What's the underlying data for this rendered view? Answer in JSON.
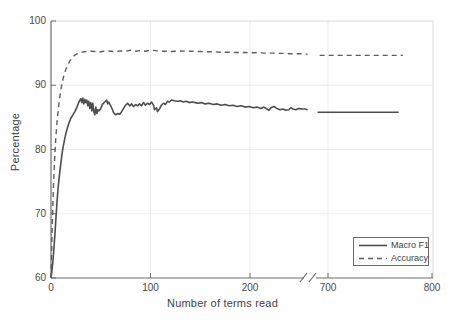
{
  "chart_data": {
    "type": "line",
    "title": "",
    "xlabel": "Number of terms read",
    "ylabel": "Percentage",
    "ylim": [
      60,
      100
    ],
    "yticks": [
      {
        "value": 60,
        "label": "60"
      },
      {
        "value": 70,
        "label": "70"
      },
      {
        "value": 80,
        "label": "80"
      },
      {
        "value": 90,
        "label": "90"
      },
      {
        "value": 100,
        "label": "100"
      }
    ],
    "xticks": [
      {
        "value": 0,
        "label": "0"
      },
      {
        "value": 100,
        "label": "100"
      },
      {
        "value": 200,
        "label": "200"
      },
      {
        "value": 700,
        "label": "700"
      },
      {
        "value": 800,
        "label": "800"
      }
    ],
    "x_axis_break": {
      "between": [
        260,
        690
      ],
      "style": "double-slash"
    },
    "grid": true,
    "legend_position": "lower-right",
    "series": [
      {
        "name": "Macro F1",
        "style": "solid",
        "color": "#4d4d4d",
        "segments": [
          [
            [
              0,
              60
            ],
            [
              1,
              61.2
            ],
            [
              2,
              62.8
            ],
            [
              3,
              64.8
            ],
            [
              4,
              67
            ],
            [
              5,
              69.5
            ],
            [
              6,
              71.8
            ],
            [
              7,
              73.8
            ],
            [
              8,
              75.4
            ],
            [
              9,
              76.8
            ],
            [
              10,
              78
            ],
            [
              11,
              79.2
            ],
            [
              12,
              80.2
            ],
            [
              13,
              81
            ],
            [
              14,
              81.8
            ],
            [
              15,
              82.5
            ],
            [
              16,
              83.1
            ],
            [
              17,
              83.6
            ],
            [
              18,
              84.1
            ],
            [
              19,
              84.5
            ],
            [
              20,
              84.9
            ],
            [
              22,
              85.4
            ],
            [
              24,
              85.9
            ],
            [
              26,
              86.6
            ],
            [
              28,
              87.4
            ],
            [
              30,
              87.9
            ],
            [
              31,
              87.3
            ],
            [
              32,
              88
            ],
            [
              33,
              87.1
            ],
            [
              34,
              87.8
            ],
            [
              35,
              87.3
            ],
            [
              36,
              87.7
            ],
            [
              37,
              86.8
            ],
            [
              38,
              87.5
            ],
            [
              39,
              86.4
            ],
            [
              40,
              87.3
            ],
            [
              41,
              86
            ],
            [
              42,
              87.2
            ],
            [
              43,
              85.9
            ],
            [
              44,
              85.4
            ],
            [
              45,
              86.6
            ],
            [
              46,
              85.6
            ],
            [
              47,
              86.2
            ],
            [
              48,
              86
            ],
            [
              50,
              86.4
            ],
            [
              52,
              87.1
            ],
            [
              54,
              87.4
            ],
            [
              56,
              87.7
            ],
            [
              57,
              87.1
            ],
            [
              58,
              87.4
            ],
            [
              60,
              86.8
            ],
            [
              62,
              86.1
            ],
            [
              63,
              85.7
            ],
            [
              65,
              85.4
            ],
            [
              67,
              85.6
            ],
            [
              69,
              85.5
            ],
            [
              71,
              85.9
            ],
            [
              73,
              86.4
            ],
            [
              75,
              86.9
            ],
            [
              77,
              87.2
            ],
            [
              79,
              86.8
            ],
            [
              81,
              87.1
            ],
            [
              83,
              86.7
            ],
            [
              85,
              87
            ],
            [
              87,
              86.8
            ],
            [
              89,
              87.1
            ],
            [
              91,
              86.8
            ],
            [
              93,
              87.3
            ],
            [
              95,
              86.9
            ],
            [
              97,
              87.2
            ],
            [
              99,
              87
            ],
            [
              101,
              87.4
            ],
            [
              103,
              86.9
            ],
            [
              104,
              86.2
            ],
            [
              106,
              86.5
            ],
            [
              107,
              85.9
            ],
            [
              109,
              86.3
            ],
            [
              111,
              86.9
            ],
            [
              113,
              87.2
            ],
            [
              115,
              87
            ],
            [
              117,
              87.5
            ],
            [
              119,
              87.4
            ],
            [
              121,
              87.7
            ],
            [
              124,
              87.6
            ],
            [
              127,
              87.5
            ],
            [
              130,
              87.6
            ],
            [
              133,
              87.4
            ],
            [
              136,
              87.5
            ],
            [
              139,
              87.3
            ],
            [
              142,
              87.4
            ],
            [
              145,
              87.3
            ],
            [
              148,
              87.2
            ],
            [
              151,
              87.3
            ],
            [
              155,
              87.1
            ],
            [
              159,
              87.2
            ],
            [
              163,
              87
            ],
            [
              167,
              87.1
            ],
            [
              171,
              86.9
            ],
            [
              175,
              87
            ],
            [
              179,
              86.8
            ],
            [
              183,
              86.9
            ],
            [
              187,
              86.7
            ],
            [
              191,
              86.8
            ],
            [
              195,
              86.6
            ],
            [
              199,
              86.7
            ],
            [
              203,
              86.5
            ],
            [
              207,
              86.6
            ],
            [
              211,
              86.4
            ],
            [
              214,
              86.6
            ],
            [
              217,
              86.3
            ],
            [
              219,
              86.1
            ],
            [
              221,
              86.5
            ],
            [
              224,
              86.7
            ],
            [
              227,
              86.4
            ],
            [
              230,
              86.2
            ],
            [
              233,
              86.3
            ],
            [
              236,
              86.1
            ],
            [
              239,
              86.2
            ],
            [
              241,
              86.5
            ],
            [
              243,
              86.3
            ],
            [
              246,
              86.2
            ],
            [
              249,
              86.4
            ],
            [
              252,
              86.3
            ],
            [
              255,
              86.3
            ],
            [
              258,
              86.2
            ]
          ],
          [
            [
              690,
              85.8
            ],
            [
              768,
              85.8
            ]
          ]
        ]
      },
      {
        "name": "Accuracy",
        "style": "dashed",
        "color": "#5e5e5e",
        "segments": [
          [
            [
              0,
              60
            ],
            [
              0.5,
              63
            ],
            [
              1,
              66.5
            ],
            [
              1.5,
              69.5
            ],
            [
              2,
              72
            ],
            [
              2.5,
              74.3
            ],
            [
              3,
              76.3
            ],
            [
              3.5,
              78
            ],
            [
              4,
              79.6
            ],
            [
              4.5,
              81
            ],
            [
              5,
              82.2
            ],
            [
              6,
              84.2
            ],
            [
              7,
              85.8
            ],
            [
              8,
              87.2
            ],
            [
              9,
              88.4
            ],
            [
              10,
              89.4
            ],
            [
              11,
              90.2
            ],
            [
              12,
              90.9
            ],
            [
              13,
              91.5
            ],
            [
              14,
              92
            ],
            [
              15,
              92.5
            ],
            [
              16,
              92.9
            ],
            [
              17,
              93.2
            ],
            [
              18,
              93.5
            ],
            [
              19,
              93.8
            ],
            [
              20,
              94
            ],
            [
              22,
              94.4
            ],
            [
              24,
              94.7
            ],
            [
              26,
              94.9
            ],
            [
              28,
              95
            ],
            [
              30,
              95.1
            ],
            [
              33,
              95.2
            ],
            [
              36,
              95.25
            ],
            [
              40,
              95.3
            ],
            [
              45,
              95.25
            ],
            [
              50,
              95.2
            ],
            [
              55,
              95.35
            ],
            [
              60,
              95.3
            ],
            [
              65,
              95.2
            ],
            [
              70,
              95.35
            ],
            [
              75,
              95.3
            ],
            [
              80,
              95.45
            ],
            [
              85,
              95.3
            ],
            [
              90,
              95.4
            ],
            [
              95,
              95.3
            ],
            [
              100,
              95.45
            ],
            [
              105,
              95.4
            ],
            [
              110,
              95.3
            ],
            [
              115,
              95.3
            ],
            [
              120,
              95.25
            ],
            [
              125,
              95.3
            ],
            [
              130,
              95.35
            ],
            [
              135,
              95.3
            ],
            [
              140,
              95.3
            ],
            [
              145,
              95.25
            ],
            [
              150,
              95.25
            ],
            [
              155,
              95.2
            ],
            [
              160,
              95.2
            ],
            [
              165,
              95.2
            ],
            [
              170,
              95.15
            ],
            [
              175,
              95.15
            ],
            [
              180,
              95.15
            ],
            [
              185,
              95.1
            ],
            [
              190,
              95.1
            ],
            [
              195,
              95.1
            ],
            [
              200,
              95.05
            ],
            [
              205,
              95.05
            ],
            [
              210,
              95.05
            ],
            [
              215,
              95
            ],
            [
              220,
              95
            ],
            [
              225,
              95
            ],
            [
              230,
              94.95
            ],
            [
              235,
              94.95
            ],
            [
              240,
              94.9
            ],
            [
              245,
              94.9
            ],
            [
              250,
              94.9
            ],
            [
              255,
              94.85
            ],
            [
              258,
              94.85
            ]
          ],
          [
            [
              692,
              94.65
            ],
            [
              772,
              94.65
            ]
          ]
        ]
      }
    ],
    "colors": {
      "axis": "#6e6e6e",
      "box_light": "#d9d9d9",
      "grid": "#ebebeb",
      "tick_text": "#4a4a4a",
      "background": "#fefefe"
    }
  },
  "legend": {
    "items": [
      {
        "label": "Macro F1",
        "line": "solid"
      },
      {
        "label": "Accuracy",
        "line": "dashed"
      }
    ]
  }
}
